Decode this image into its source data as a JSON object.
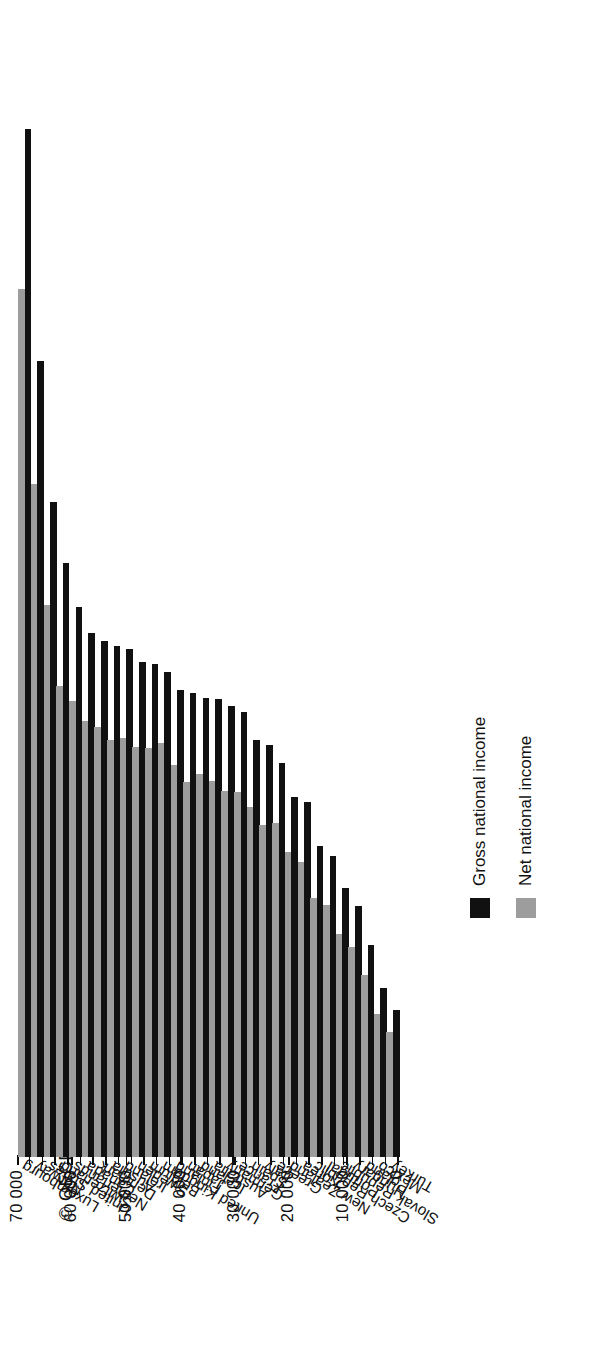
{
  "copyright": "© OECD 2008",
  "legend": {
    "position": "right",
    "items": [
      {
        "label": "Gross national income",
        "color": "#111111",
        "key": "gni"
      },
      {
        "label": "Net national income",
        "color": "#9d9d9d",
        "key": "nni"
      }
    ]
  },
  "axis": {
    "ticks": [
      "0",
      "10 000",
      "20 000",
      "30 000",
      "40 000",
      "50 000",
      "60 000",
      "70 000"
    ],
    "tick_values": [
      0,
      10000,
      20000,
      30000,
      40000,
      50000,
      60000,
      70000
    ],
    "min": 0,
    "max": 70000
  },
  "chart_data": {
    "type": "bar",
    "orientation": "horizontal",
    "title": "",
    "xlabel": "",
    "ylabel": "",
    "ylim": [
      0,
      70000
    ],
    "grid": false,
    "legend_position": "right",
    "categories": [
      "Luxembourg",
      "Norway",
      "United States",
      "Switzerland",
      "Netherlands",
      "Canada",
      "Denmark",
      "Austria",
      "Ireland",
      "Sweden",
      "Belgium",
      "United Kingdom",
      "Finland",
      "Japan",
      "Iceland",
      "Australia",
      "Germany",
      "France",
      "Spain",
      "Italy",
      "Greece",
      "New Zealand",
      "Korea",
      "Czech Republic",
      "Portugal",
      "Slovak Republic",
      "Hungary",
      "Poland",
      "Mexico",
      "Turkey"
    ],
    "series": [
      {
        "name": "Gross national income",
        "color": "#111111",
        "values": [
          63100,
          48900,
          40200,
          36500,
          33800,
          32200,
          31700,
          31400,
          31200,
          30400,
          30300,
          29800,
          28700,
          28500,
          28200,
          28100,
          27700,
          27300,
          25600,
          25300,
          24200,
          22100,
          21800,
          19100,
          18500,
          16500,
          15400,
          13000,
          10400,
          9000
        ]
      },
      {
        "name": "Net national income",
        "color": "#9d9d9d",
        "values": [
          53300,
          41300,
          33900,
          28900,
          28000,
          26800,
          26400,
          25600,
          25700,
          25200,
          25100,
          25400,
          24100,
          23000,
          23500,
          23100,
          22500,
          22400,
          21500,
          20400,
          20500,
          18700,
          18100,
          15900,
          15500,
          13700,
          12900,
          11200,
          8800,
          7700
        ]
      }
    ]
  }
}
